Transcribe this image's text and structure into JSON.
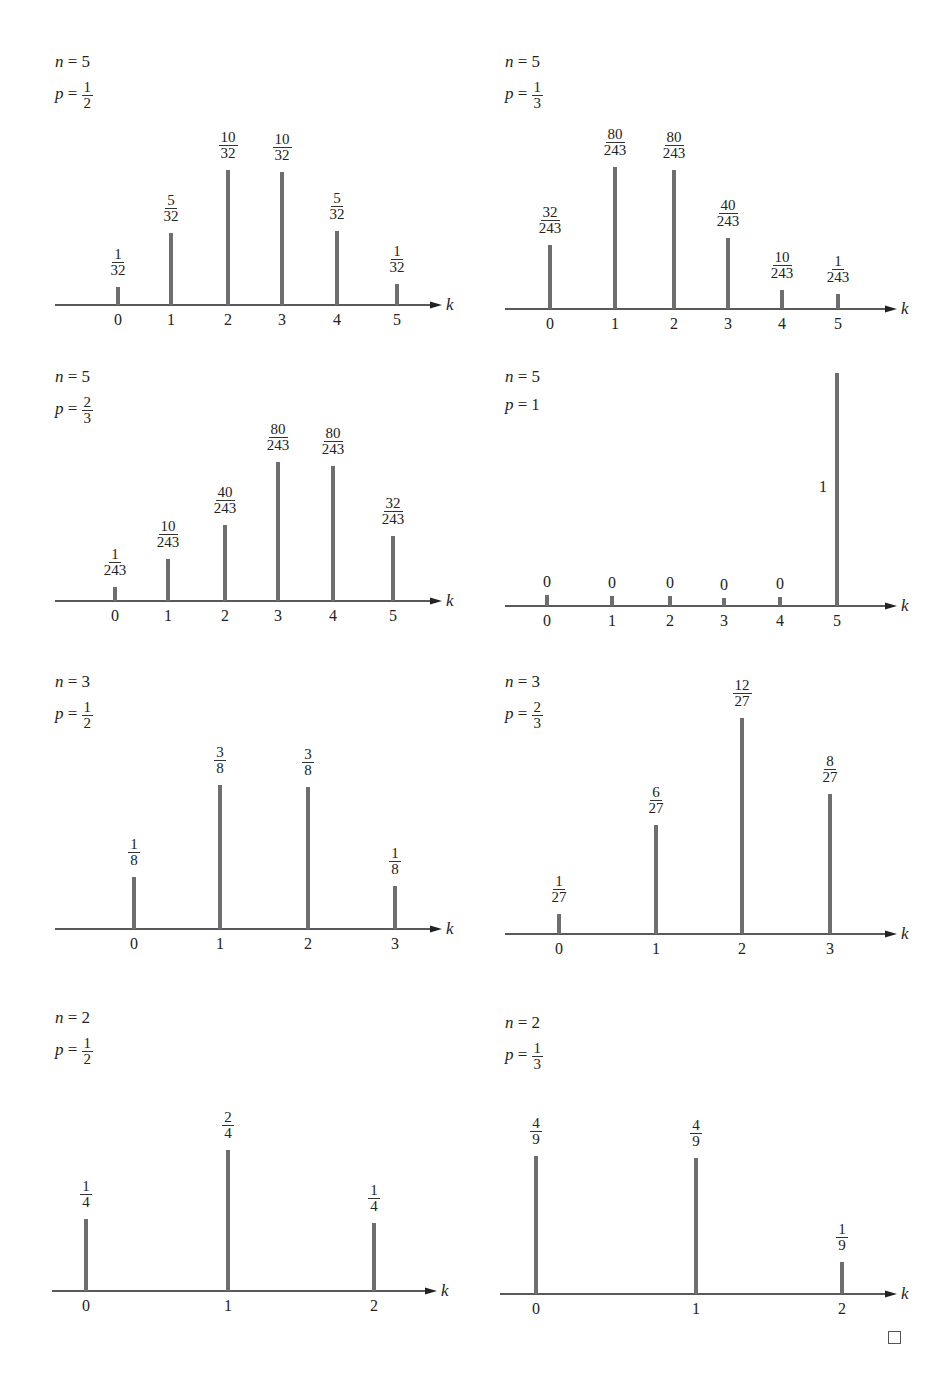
{
  "chart_data": [
    {
      "type": "bar",
      "title": "n = 5, p = 1/2",
      "n": "5",
      "p": "1/2",
      "xlabel": "k",
      "categories": [
        "0",
        "1",
        "2",
        "3",
        "4",
        "5"
      ],
      "labels": [
        "1/32",
        "5/32",
        "10/32",
        "10/32",
        "5/32",
        "1/32"
      ],
      "values": [
        0.03125,
        0.15625,
        0.3125,
        0.3125,
        0.15625,
        0.03125
      ]
    },
    {
      "type": "bar",
      "title": "n = 5, p = 1/3",
      "n": "5",
      "p": "1/3",
      "xlabel": "k",
      "categories": [
        "0",
        "1",
        "2",
        "3",
        "4",
        "5"
      ],
      "labels": [
        "32/243",
        "80/243",
        "80/243",
        "40/243",
        "10/243",
        "1/243"
      ],
      "values": [
        0.1317,
        0.3292,
        0.3292,
        0.1646,
        0.0412,
        0.0041
      ]
    },
    {
      "type": "bar",
      "title": "n = 5, p = 2/3",
      "n": "5",
      "p": "2/3",
      "xlabel": "k",
      "categories": [
        "0",
        "1",
        "2",
        "3",
        "4",
        "5"
      ],
      "labels": [
        "1/243",
        "10/243",
        "40/243",
        "80/243",
        "80/243",
        "32/243"
      ],
      "values": [
        0.0041,
        0.0412,
        0.1646,
        0.3292,
        0.3292,
        0.1317
      ]
    },
    {
      "type": "bar",
      "title": "n = 5, p = 1",
      "n": "5",
      "p": "1",
      "xlabel": "k",
      "categories": [
        "0",
        "1",
        "2",
        "3",
        "4",
        "5"
      ],
      "labels": [
        "0",
        "0",
        "0",
        "0",
        "0",
        "1"
      ],
      "values": [
        0,
        0,
        0,
        0,
        0,
        1
      ]
    },
    {
      "type": "bar",
      "title": "n = 3, p = 1/2",
      "n": "3",
      "p": "1/2",
      "xlabel": "k",
      "categories": [
        "0",
        "1",
        "2",
        "3"
      ],
      "labels": [
        "1/8",
        "3/8",
        "3/8",
        "1/8"
      ],
      "values": [
        0.125,
        0.375,
        0.375,
        0.125
      ]
    },
    {
      "type": "bar",
      "title": "n = 3, p = 2/3",
      "n": "3",
      "p": "2/3",
      "xlabel": "k",
      "categories": [
        "0",
        "1",
        "2",
        "3"
      ],
      "labels": [
        "1/27",
        "6/27",
        "12/27",
        "8/27"
      ],
      "values": [
        0.037,
        0.2222,
        0.4444,
        0.2963
      ]
    },
    {
      "type": "bar",
      "title": "n = 2, p = 1/2",
      "n": "2",
      "p": "1/2",
      "xlabel": "k",
      "categories": [
        "0",
        "1",
        "2"
      ],
      "labels": [
        "1/4",
        "2/4",
        "1/4"
      ],
      "values": [
        0.25,
        0.5,
        0.25
      ]
    },
    {
      "type": "bar",
      "title": "n = 2, p = 1/3",
      "n": "2",
      "p": "1/3",
      "xlabel": "k",
      "categories": [
        "0",
        "1",
        "2"
      ],
      "labels": [
        "4/9",
        "4/9",
        "1/9"
      ],
      "values": [
        0.4444,
        0.4444,
        0.1111
      ]
    }
  ],
  "layout": [
    {
      "left": 55,
      "top": 52,
      "axisY": 305,
      "axisX0": 55,
      "axisX1": 430,
      "xs": [
        118,
        171,
        228,
        282,
        337,
        397
      ],
      "tops": [
        287,
        233,
        170,
        172,
        231,
        284
      ],
      "paramTop": 0
    },
    {
      "left": 505,
      "top": 52,
      "axisY": 309,
      "axisX0": 505,
      "axisX1": 885,
      "xs": [
        550,
        615,
        674,
        728,
        782,
        838
      ],
      "tops": [
        245,
        167,
        170,
        238,
        290,
        294
      ],
      "paramTop": 0
    },
    {
      "left": 55,
      "top": 367,
      "axisY": 601,
      "axisX0": 55,
      "axisX1": 430,
      "xs": [
        115,
        168,
        225,
        278,
        333,
        393
      ],
      "tops": [
        587,
        559,
        525,
        462,
        466,
        536
      ],
      "paramTop": 0
    },
    {
      "left": 505,
      "top": 367,
      "axisY": 606,
      "axisX0": 505,
      "axisX1": 885,
      "xs": [
        547,
        612,
        670,
        724,
        780,
        837
      ],
      "tops": [
        595,
        596,
        596,
        598,
        597,
        373
      ],
      "paramTop": 0
    },
    {
      "left": 55,
      "top": 672,
      "axisY": 929,
      "axisX0": 55,
      "axisX1": 430,
      "xs": [
        134,
        220,
        308,
        395
      ],
      "tops": [
        877,
        785,
        787,
        886
      ],
      "paramTop": 0
    },
    {
      "left": 505,
      "top": 672,
      "axisY": 934,
      "axisX0": 505,
      "axisX1": 885,
      "xs": [
        559,
        656,
        742,
        830
      ],
      "tops": [
        914,
        825,
        718,
        794
      ],
      "paramTop": 0
    },
    {
      "left": 55,
      "top": 1008,
      "axisY": 1291,
      "axisX0": 52,
      "axisX1": 425,
      "xs": [
        86,
        228,
        374
      ],
      "tops": [
        1219,
        1150,
        1223
      ],
      "paramTop": 0
    },
    {
      "left": 505,
      "top": 1013,
      "axisY": 1294,
      "axisX0": 500,
      "axisX1": 885,
      "xs": [
        536,
        696,
        842
      ],
      "tops": [
        1156,
        1158,
        1262
      ],
      "paramTop": 0
    }
  ],
  "colors": {
    "stem": "#6e6e6e",
    "axis": "#222222",
    "text": "#222222"
  },
  "end_mark": "□"
}
